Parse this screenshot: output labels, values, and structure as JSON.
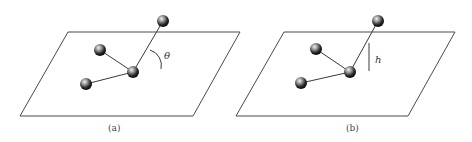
{
  "panels": [
    {
      "id": "a",
      "caption": "(a)",
      "annotation_symbol": "θ",
      "annotation_type": "angle",
      "plane": [
        [
          68,
          32
        ],
        [
          240,
          32
        ],
        [
          193,
          116
        ],
        [
          20,
          116
        ]
      ],
      "atoms": [
        [
          163,
          21
        ],
        [
          100,
          50
        ],
        [
          133,
          72
        ],
        [
          86,
          84
        ]
      ],
      "bonds": [
        [
          0,
          2
        ],
        [
          1,
          2
        ],
        [
          3,
          2
        ]
      ],
      "label_pos": [
        164,
        59
      ],
      "caption_pos": [
        108,
        131
      ]
    },
    {
      "id": "b",
      "caption": "(b)",
      "annotation_symbol": "h",
      "annotation_type": "height",
      "plane": [
        [
          284,
          32
        ],
        [
          455,
          32
        ],
        [
          408,
          116
        ],
        [
          236,
          116
        ]
      ],
      "atoms": [
        [
          378,
          21
        ],
        [
          316,
          49
        ],
        [
          350,
          72
        ],
        [
          301,
          83
        ]
      ],
      "bonds": [
        [
          0,
          2
        ],
        [
          1,
          2
        ],
        [
          3,
          2
        ]
      ],
      "label_pos": [
        375,
        63
      ],
      "caption_pos": [
        346,
        131
      ]
    }
  ],
  "colors": {
    "line": "#4a4a4a",
    "atom_dark": "#1a1a1a",
    "atom_light": "#e8e8e8"
  }
}
